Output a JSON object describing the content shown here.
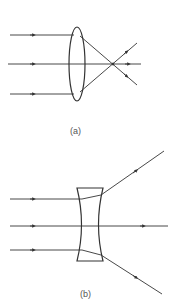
{
  "figure": {
    "panels": [
      {
        "id": "a",
        "caption": "(a)",
        "lens_type": "converging (convex) lens",
        "description": "Three parallel incident rays pass through a convex lens and converge at a focal point, then continue and diverge."
      },
      {
        "id": "b",
        "caption": "(b)",
        "lens_type": "diverging (concave) lens",
        "description": "Three parallel incident rays pass through a concave lens; the outer rays diverge away from the axis, the central ray passes straight through."
      }
    ],
    "colors": {
      "line": "#333333",
      "caption": "#555555",
      "background": "#ffffff"
    }
  }
}
